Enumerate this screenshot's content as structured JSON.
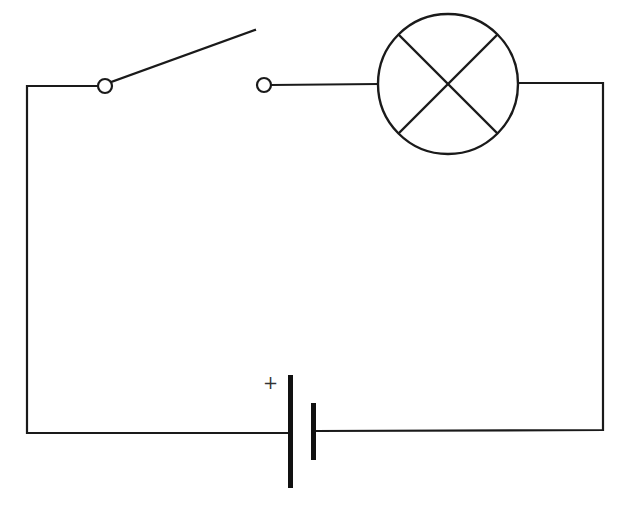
{
  "diagram": {
    "type": "circuit-schematic",
    "colors": {
      "line": "#1a1a1a",
      "background": "#ffffff"
    },
    "components": [
      {
        "id": "battery",
        "kind": "cell",
        "polarity_label": "+"
      },
      {
        "id": "switch",
        "kind": "single-pole switch",
        "state": "open"
      },
      {
        "id": "lamp",
        "kind": "lamp (filament bulb symbol)"
      }
    ],
    "labels": {
      "battery_positive": "+"
    }
  }
}
